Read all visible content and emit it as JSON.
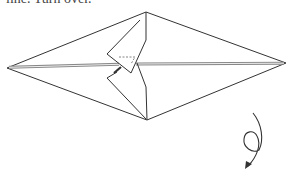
{
  "caption": "line. Turn over.",
  "diagram": {
    "shape": "elongated diamond with folded center flaps",
    "arrow": {
      "type": "turn-over",
      "symbol": "loop arrow"
    },
    "colors": {
      "line": "#333333",
      "crease": "#999999",
      "background": "#ffffff"
    }
  }
}
